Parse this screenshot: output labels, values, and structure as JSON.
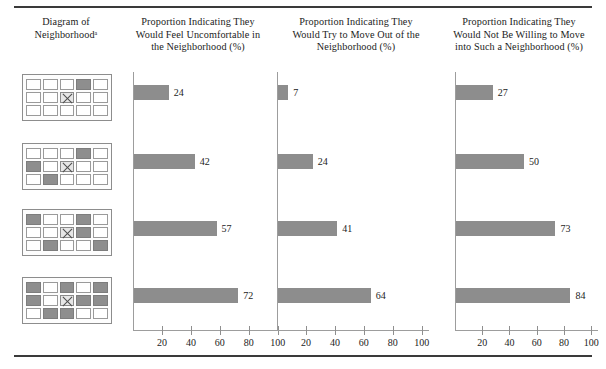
{
  "figure": {
    "rules": [
      "top-rule",
      "bottom-rule"
    ]
  },
  "columns": [
    {
      "id": "diagram",
      "header": "Diagram of\nNeighborhoodᵃ"
    },
    {
      "id": "uncomfortable",
      "header": "Proportion Indicating They\nWould Feel Uncomfortable in\nthe Neighborhood (%)"
    },
    {
      "id": "move-out",
      "header": "Proportion Indicating They\nWould Try to Move Out of the\nNeighborhood (%)"
    },
    {
      "id": "not-willing",
      "header": "Proportion Indicating They\nWould Not Be Willing to Move\ninto Such a Neighborhood (%)"
    }
  ],
  "diagrams": [
    {
      "name": "neighborhood-diagram-1",
      "rows": [
        [
          "empty",
          "empty",
          "empty",
          "filled",
          "empty"
        ],
        [
          "empty",
          "empty",
          "x",
          "empty",
          "empty"
        ],
        [
          "empty",
          "empty",
          "empty",
          "empty",
          "empty"
        ]
      ]
    },
    {
      "name": "neighborhood-diagram-2",
      "rows": [
        [
          "empty",
          "empty",
          "empty",
          "filled",
          "empty"
        ],
        [
          "filled",
          "empty",
          "x",
          "empty",
          "empty"
        ],
        [
          "empty",
          "filled",
          "empty",
          "empty",
          "empty"
        ]
      ]
    },
    {
      "name": "neighborhood-diagram-3",
      "rows": [
        [
          "filled",
          "empty",
          "empty",
          "filled",
          "empty"
        ],
        [
          "empty",
          "empty",
          "x",
          "filled",
          "empty"
        ],
        [
          "empty",
          "filled",
          "empty",
          "empty",
          "filled"
        ]
      ]
    },
    {
      "name": "neighborhood-diagram-4",
      "rows": [
        [
          "filled",
          "empty",
          "filled",
          "empty",
          "filled"
        ],
        [
          "filled",
          "empty",
          "x",
          "filled",
          "filled"
        ],
        [
          "empty",
          "filled",
          "filled",
          "empty",
          "empty"
        ]
      ]
    }
  ],
  "chart_data": [
    {
      "type": "bar",
      "orientation": "horizontal",
      "title": "Proportion Indicating They Would Feel Uncomfortable in the Neighborhood (%)",
      "xlabel": "",
      "ylabel": "",
      "categories": [
        "1 black of 15",
        "3 black of 15",
        "5 black of 15",
        "8 black of 15"
      ],
      "values": [
        24,
        42,
        57,
        72
      ],
      "data_labels": [
        "24",
        "42",
        "57",
        "72"
      ],
      "xlim": [
        0,
        105
      ],
      "xticks": [
        20,
        40,
        60,
        80,
        100
      ],
      "xtick_labels": [
        "20",
        "40",
        "60",
        "80",
        "100"
      ],
      "grid": false,
      "legend": "none",
      "bar_color": "#8d8d8d"
    },
    {
      "type": "bar",
      "orientation": "horizontal",
      "title": "Proportion Indicating They Would Try to Move Out of the Neighborhood (%)",
      "xlabel": "",
      "ylabel": "",
      "categories": [
        "1 black of 15",
        "3 black of 15",
        "5 black of 15",
        "8 black of 15"
      ],
      "values": [
        7,
        24,
        41,
        64
      ],
      "data_labels": [
        "7",
        "24",
        "41",
        "64"
      ],
      "xlim": [
        0,
        105
      ],
      "xticks": [
        20,
        40,
        60,
        80,
        100
      ],
      "xtick_labels": [
        "20",
        "40",
        "60",
        "80",
        "100"
      ],
      "grid": false,
      "legend": "none",
      "bar_color": "#8d8d8d"
    },
    {
      "type": "bar",
      "orientation": "horizontal",
      "title": "Proportion Indicating They Would Not Be Willing to Move into Such a Neighborhood (%)",
      "xlabel": "",
      "ylabel": "",
      "categories": [
        "1 black of 15",
        "3 black of 15",
        "5 black of 15",
        "8 black of 15"
      ],
      "values": [
        27,
        50,
        73,
        84
      ],
      "data_labels": [
        "27",
        "50",
        "73",
        "84"
      ],
      "xlim": [
        0,
        105
      ],
      "xticks": [
        20,
        40,
        60,
        80,
        100
      ],
      "xtick_labels": [
        "20",
        "40",
        "60",
        "80",
        "100"
      ],
      "grid": false,
      "legend": "none",
      "bar_color": "#8d8d8d"
    }
  ]
}
